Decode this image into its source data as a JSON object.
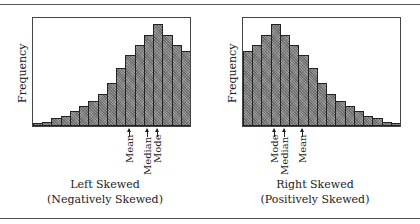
{
  "chart_data": [
    {
      "type": "bar",
      "title": "Left Skewed",
      "subtitle": "(Negatively Skewed)",
      "xlabel": "",
      "ylabel": "Frequency",
      "grid": false,
      "legend": null,
      "categories": [
        "1",
        "2",
        "3",
        "4",
        "5",
        "6",
        "7",
        "8",
        "9",
        "10",
        "11",
        "12",
        "13",
        "14",
        "15",
        "16",
        "17"
      ],
      "values": [
        3,
        4,
        8,
        10,
        15,
        20,
        25,
        33,
        44,
        59,
        72,
        83,
        93,
        104,
        93,
        83,
        76
      ],
      "annotations": [
        {
          "label": "Mean",
          "bar_index": 10
        },
        {
          "label": "Median",
          "bar_index": 12
        },
        {
          "label": "Mode",
          "bar_index": 13
        }
      ]
    },
    {
      "type": "bar",
      "title": "Right Skewed",
      "subtitle": "(Positively Skewed)",
      "xlabel": "",
      "ylabel": "Frequency",
      "grid": false,
      "legend": null,
      "categories": [
        "1",
        "2",
        "3",
        "4",
        "5",
        "6",
        "7",
        "8",
        "9",
        "10",
        "11",
        "12",
        "13",
        "14",
        "15",
        "16",
        "17"
      ],
      "values": [
        76,
        83,
        93,
        104,
        93,
        83,
        72,
        59,
        44,
        33,
        25,
        20,
        15,
        10,
        8,
        4,
        3
      ],
      "annotations": [
        {
          "label": "Mode",
          "bar_index": 3
        },
        {
          "label": "Median",
          "bar_index": 4
        },
        {
          "label": "Mean",
          "bar_index": 6
        }
      ]
    }
  ],
  "left": {
    "ylabel": "Frequency",
    "title": "Left Skewed",
    "subtitle": "(Negatively Skewed)",
    "markers": [
      "Mean",
      "Median",
      "Mode"
    ]
  },
  "right": {
    "ylabel": "Frequency",
    "title": "Right Skewed",
    "subtitle": "(Positively Skewed)",
    "markers": [
      "Mode",
      "Median",
      "Mean"
    ]
  }
}
